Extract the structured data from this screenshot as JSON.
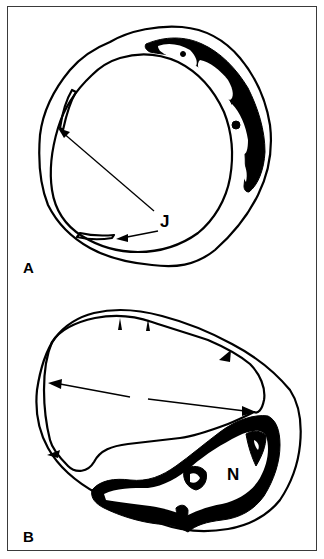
{
  "figure": {
    "panels": [
      {
        "id": "A",
        "label": "A",
        "annotations": [
          {
            "label": "J",
            "arrows": 2
          }
        ]
      },
      {
        "id": "B",
        "label": "B",
        "annotations": [
          {
            "label": "N",
            "arrows": 0
          }
        ],
        "arrowheads": 5,
        "double_arrow": true
      }
    ],
    "colors": {
      "line": "#000000",
      "background": "#ffffff",
      "frame": "#3a3a3a"
    }
  }
}
